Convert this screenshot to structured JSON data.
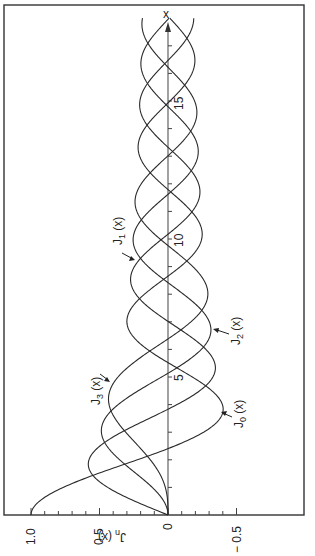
{
  "chart_data": {
    "type": "line",
    "title": "",
    "orientation": "rotated 90° counter-clockwise (x-axis vertical, pointing up; J axis horizontal at bottom, increasing to the left)",
    "xlabel": "x",
    "ylabel": "J_n (x)",
    "xlim": [
      0,
      18
    ],
    "ylim": [
      -0.6,
      1.0
    ],
    "x_ticks": [
      0,
      1,
      2,
      3,
      4,
      5,
      6,
      7,
      8,
      9,
      10,
      11,
      12,
      13,
      14,
      15,
      16,
      17
    ],
    "x_tick_labels": [
      {
        "value": 5,
        "label": "5"
      },
      {
        "value": 10,
        "label": "10"
      },
      {
        "value": 15,
        "label": "15"
      }
    ],
    "y_ticks": [
      1.0,
      0.9,
      0.8,
      0.7,
      0.6,
      0.5,
      0.4,
      0.3,
      0.2,
      0.1,
      0,
      -0.1,
      -0.2,
      -0.3,
      -0.4,
      -0.5
    ],
    "y_tick_labels": [
      {
        "value": 1.0,
        "label": "1.0"
      },
      {
        "value": 0.5,
        "label": "0.5"
      },
      {
        "value": 0,
        "label": "0"
      },
      {
        "value": -0.5,
        "label": "− 0.5"
      }
    ],
    "grid": false,
    "series": [
      {
        "name": "J_0 (x)",
        "order": 0,
        "x": [
          0,
          1,
          2,
          2.405,
          3,
          3.832,
          4,
          5,
          5.52,
          6,
          7,
          7.016,
          8,
          8.654,
          9,
          10,
          10.17,
          11,
          11.79,
          12,
          13,
          13.32,
          14,
          14.93,
          15,
          16,
          16.47,
          17,
          18
        ],
        "values": [
          1.0,
          0.765,
          0.224,
          0.0,
          -0.26,
          -0.403,
          -0.397,
          -0.178,
          0.0,
          0.151,
          0.3,
          0.3,
          0.172,
          0.0,
          -0.09,
          -0.246,
          -0.25,
          -0.171,
          0.0,
          0.048,
          0.207,
          0.218,
          0.171,
          0.0,
          -0.014,
          -0.175,
          -0.202,
          -0.17,
          -0.013
        ]
      },
      {
        "name": "J_1 (x)",
        "order": 1,
        "x": [
          0,
          1,
          1.841,
          2,
          3,
          3.832,
          4,
          5,
          5.331,
          6,
          7,
          7.016,
          8,
          8.536,
          9,
          10,
          10.17,
          11,
          11.71,
          12,
          13,
          13.32,
          14,
          14.86,
          15,
          16,
          16.47,
          17,
          18
        ],
        "values": [
          0.0,
          0.44,
          0.582,
          0.577,
          0.339,
          0.0,
          -0.066,
          -0.328,
          -0.346,
          -0.277,
          -0.005,
          0.0,
          0.235,
          0.273,
          0.245,
          0.043,
          0.0,
          -0.177,
          -0.232,
          -0.223,
          -0.07,
          0.0,
          0.133,
          0.207,
          0.205,
          0.09,
          0.0,
          -0.098,
          -0.188
        ]
      },
      {
        "name": "J_2 (x)",
        "order": 2,
        "x": [
          0,
          1,
          2,
          3,
          3.054,
          4,
          5,
          5.136,
          6,
          6.706,
          7,
          8,
          8.417,
          9,
          9.969,
          10,
          11,
          11.62,
          12,
          13,
          13.59,
          14,
          15,
          15.48,
          16,
          17,
          18
        ],
        "values": [
          0.0,
          0.115,
          0.353,
          0.486,
          0.487,
          0.364,
          0.047,
          0.0,
          -0.243,
          -0.314,
          -0.301,
          -0.113,
          0.0,
          0.145,
          0.255,
          0.255,
          0.139,
          0.0,
          -0.085,
          -0.218,
          -0.22,
          -0.152,
          0.042,
          0.0,
          0.186,
          0.158,
          -0.008
        ]
      },
      {
        "name": "J_3 (x)",
        "order": 3,
        "x": [
          0,
          1,
          2,
          3,
          4,
          4.201,
          5,
          6,
          6.38,
          7,
          8,
          8.015,
          9,
          9.761,
          10,
          11,
          11.35,
          12,
          13,
          13.02,
          14,
          14.8,
          15,
          16,
          16.22,
          17,
          18
        ],
        "values": [
          0.0,
          0.02,
          0.129,
          0.309,
          0.43,
          0.434,
          0.365,
          0.115,
          0.0,
          -0.168,
          -0.291,
          -0.291,
          -0.181,
          0.0,
          0.058,
          0.227,
          0.233,
          0.195,
          0.0,
          0.0,
          -0.177,
          -0.192,
          -0.194,
          -0.044,
          0.0,
          0.135,
          0.186
        ]
      }
    ],
    "annotations": [
      {
        "text": "J_0 (x)",
        "points_to_x": 3.8,
        "points_to_value": -0.4
      },
      {
        "text": "J_1 (x)",
        "points_to_x": 8.5,
        "points_to_value": 0.27
      },
      {
        "text": "J_2 (x)",
        "points_to_x": 6.7,
        "points_to_value": -0.31
      },
      {
        "text": "J_3 (x)",
        "points_to_x": 4.2,
        "points_to_value": 0.43
      }
    ],
    "legend": "none (curves labeled inline with arrows)"
  },
  "labels": {
    "x_axis": "x",
    "y_axis_main": "J",
    "y_axis_sub": "n",
    "y_axis_arg": "(x)",
    "tick_y_1": "1.0",
    "tick_y_05": "0.5",
    "tick_y_0": "0",
    "tick_y_m05": "− 0.5",
    "tick_x_5": "5",
    "tick_x_10": "10",
    "tick_x_15": "15",
    "ann_j0_main": "J",
    "ann_j0_sub": "0",
    "ann_j0_arg": " (x)",
    "ann_j1_main": "J",
    "ann_j1_sub": "1",
    "ann_j1_arg": " (x)",
    "ann_j2_main": "J",
    "ann_j2_sub": "2",
    "ann_j2_arg": " (x)",
    "ann_j3_main": "J",
    "ann_j3_sub": "3",
    "ann_j3_arg": " (x)"
  },
  "colors": {
    "curve": "#2a2a2a",
    "frame": "#333333",
    "background": "#ffffff"
  }
}
